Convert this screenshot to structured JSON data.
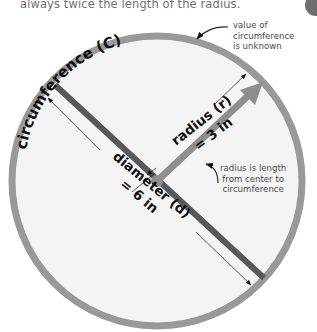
{
  "caption": "always twice the length of the radius.",
  "labels": {
    "circumference": "circumference (C)",
    "radius_name": "radius (r)",
    "radius_value": "= 3 in",
    "diameter_name": "diameter (d)",
    "diameter_value": "= 6 in"
  },
  "annotations": {
    "circumference_note": [
      "value of",
      "circumference",
      "is unknown"
    ],
    "radius_note": [
      "radius is length",
      "from center to",
      "circumference"
    ]
  },
  "colors": {
    "circle_stroke": "#999999",
    "circle_fill": "#f4f4f4",
    "diameter": "#585858",
    "radius": "#8e8e8e",
    "text": "#111111",
    "note_text": "#4a4a4a"
  }
}
